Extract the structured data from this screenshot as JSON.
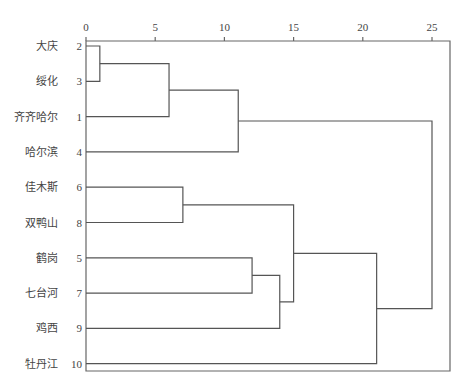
{
  "chart_data": {
    "type": "dendrogram",
    "title": "",
    "xlabel": "",
    "ylabel": "",
    "xlim": [
      0,
      25
    ],
    "x_ticks": [
      0,
      5,
      10,
      15,
      20,
      25
    ],
    "grid": false,
    "legend": null,
    "leaves": [
      {
        "name": "大庆",
        "id": 2
      },
      {
        "name": "绥化",
        "id": 3
      },
      {
        "name": "齐齐哈尔",
        "id": 1
      },
      {
        "name": "哈尔滨",
        "id": 4
      },
      {
        "name": "佳木斯",
        "id": 6
      },
      {
        "name": "双鸭山",
        "id": 8
      },
      {
        "name": "鹤岗",
        "id": 5
      },
      {
        "name": "七台河",
        "id": 7
      },
      {
        "name": "鸡西",
        "id": 9
      },
      {
        "name": "牡丹江",
        "id": 10
      }
    ],
    "merges": [
      {
        "join": [
          2,
          3
        ],
        "distance": 1
      },
      {
        "join": [
          "2,3",
          1
        ],
        "distance": 6
      },
      {
        "join": [
          "2,3,1",
          4
        ],
        "distance": 11
      },
      {
        "join": [
          6,
          8
        ],
        "distance": 7
      },
      {
        "join": [
          5,
          7
        ],
        "distance": 12
      },
      {
        "join": [
          "5,7",
          9
        ],
        "distance": 14
      },
      {
        "join": [
          "6,8",
          "5,7,9"
        ],
        "distance": 15
      },
      {
        "join": [
          "6,8,5,7,9",
          10
        ],
        "distance": 21
      },
      {
        "join": [
          "2,3,1,4",
          "6,8,5,7,9,10"
        ],
        "distance": 25
      }
    ]
  }
}
